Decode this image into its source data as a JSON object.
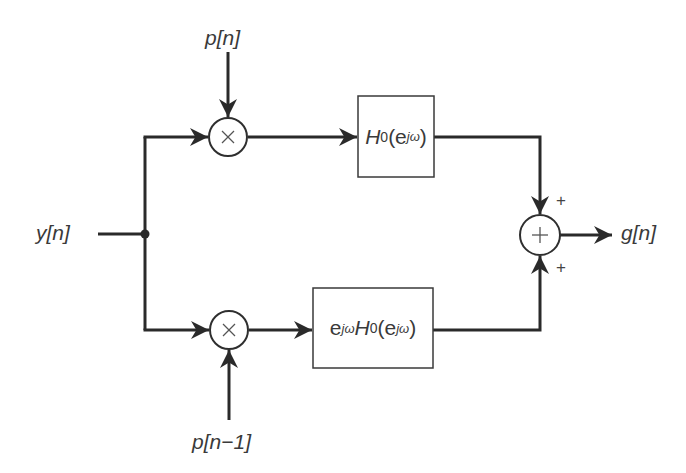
{
  "diagram": {
    "type": "signal-flow block diagram",
    "input": {
      "label": "y[n]"
    },
    "output": {
      "label": "g[n]"
    },
    "modulators": [
      {
        "id": "top",
        "operator": "×",
        "modulating_signal": "p[n]"
      },
      {
        "id": "bottom",
        "operator": "×",
        "modulating_signal": "p[n−1]"
      }
    ],
    "filters": [
      {
        "id": "top",
        "base": "H",
        "sub": "0",
        "arg_open": "(e",
        "arg_sup": "jω",
        "arg_close": ")"
      },
      {
        "id": "bottom",
        "prefix": "e",
        "prefix_sup": "jω",
        "base": "H",
        "sub": "0",
        "arg_open": "(e",
        "arg_sup": "jω",
        "arg_close": ")"
      }
    ],
    "adder": {
      "operator": "+",
      "top_sign": "+",
      "bottom_sign": "+"
    },
    "colors": {
      "line": "#2a2a2a",
      "text": "#3a3a3a",
      "background": "#ffffff"
    }
  }
}
